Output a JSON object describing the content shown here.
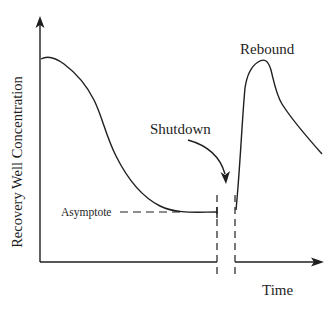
{
  "diagram": {
    "title": "",
    "axes": {
      "x_label": "Time",
      "y_label": "Recovery Well Concentration"
    },
    "annotations": {
      "rebound": "Rebound",
      "shutdown": "Shutdown",
      "asymptote": "Asymptote"
    },
    "colors": {
      "line": "#1f1f1f",
      "background": "#ffffff"
    },
    "phases": [
      {
        "name": "pumping",
        "description": "Concentration declines from initial high toward asymptote"
      },
      {
        "name": "shutdown",
        "description": "Break in time axis marked by two dashed vertical lines"
      },
      {
        "name": "rebound",
        "description": "Concentration rises sharply to a peak then declines"
      }
    ]
  }
}
